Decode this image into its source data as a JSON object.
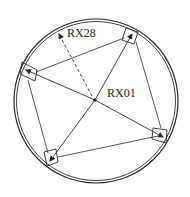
{
  "diagram": {
    "type": "sensor-array-layout",
    "labels": {
      "center": "RX01",
      "outer": "RX28"
    },
    "colors": {
      "stroke": "#2a2a2a",
      "background": "#ffffff"
    },
    "boundary": {
      "cx": 96,
      "cy": 101,
      "r": 82
    },
    "center_node": {
      "x": 95,
      "y": 100
    },
    "peripheral_nodes": [
      {
        "id": "top-right",
        "x": 132,
        "y": 34
      },
      {
        "id": "left",
        "x": 26,
        "y": 70
      },
      {
        "id": "bottom-left",
        "x": 50,
        "y": 161
      },
      {
        "id": "right",
        "x": 163,
        "y": 137
      }
    ],
    "dashed_target": {
      "x": 58,
      "y": 32
    }
  }
}
